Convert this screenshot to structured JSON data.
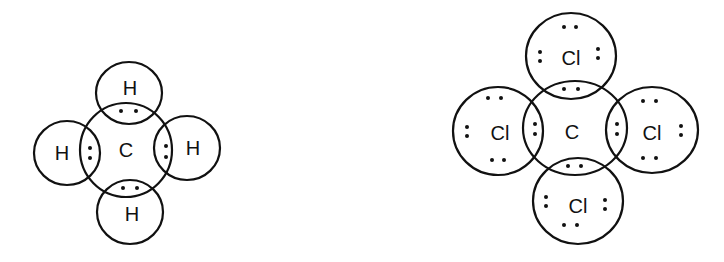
{
  "diagrams": [
    {
      "name": "methane",
      "center": {
        "label": "C",
        "cx": 126,
        "cy": 150,
        "rx": 46,
        "ry": 47
      },
      "outer": [
        {
          "pos": "top",
          "label": "H",
          "cx": 129,
          "cy": 93,
          "rx": 33,
          "ry": 31
        },
        {
          "pos": "left",
          "label": "H",
          "cx": 67,
          "cy": 153,
          "rx": 33,
          "ry": 32
        },
        {
          "pos": "right",
          "label": "H",
          "cx": 187,
          "cy": 148,
          "rx": 33,
          "ry": 32
        },
        {
          "pos": "bottom",
          "label": "H",
          "cx": 130,
          "cy": 212,
          "rx": 33,
          "ry": 32
        }
      ]
    },
    {
      "name": "carbon-tetrachloride",
      "center": {
        "label": "C",
        "cx": 575,
        "cy": 128,
        "rx": 52,
        "ry": 47
      },
      "outer": [
        {
          "pos": "top",
          "label": "Cl",
          "cx": 571,
          "cy": 56,
          "rx": 45,
          "ry": 43
        },
        {
          "pos": "left",
          "label": "Cl",
          "cx": 498,
          "cy": 131,
          "rx": 45,
          "ry": 44
        },
        {
          "pos": "right",
          "label": "Cl",
          "cx": 652,
          "cy": 130,
          "rx": 46,
          "ry": 43
        },
        {
          "pos": "bottom",
          "label": "Cl",
          "cx": 578,
          "cy": 201,
          "rx": 45,
          "ry": 43
        }
      ]
    }
  ]
}
